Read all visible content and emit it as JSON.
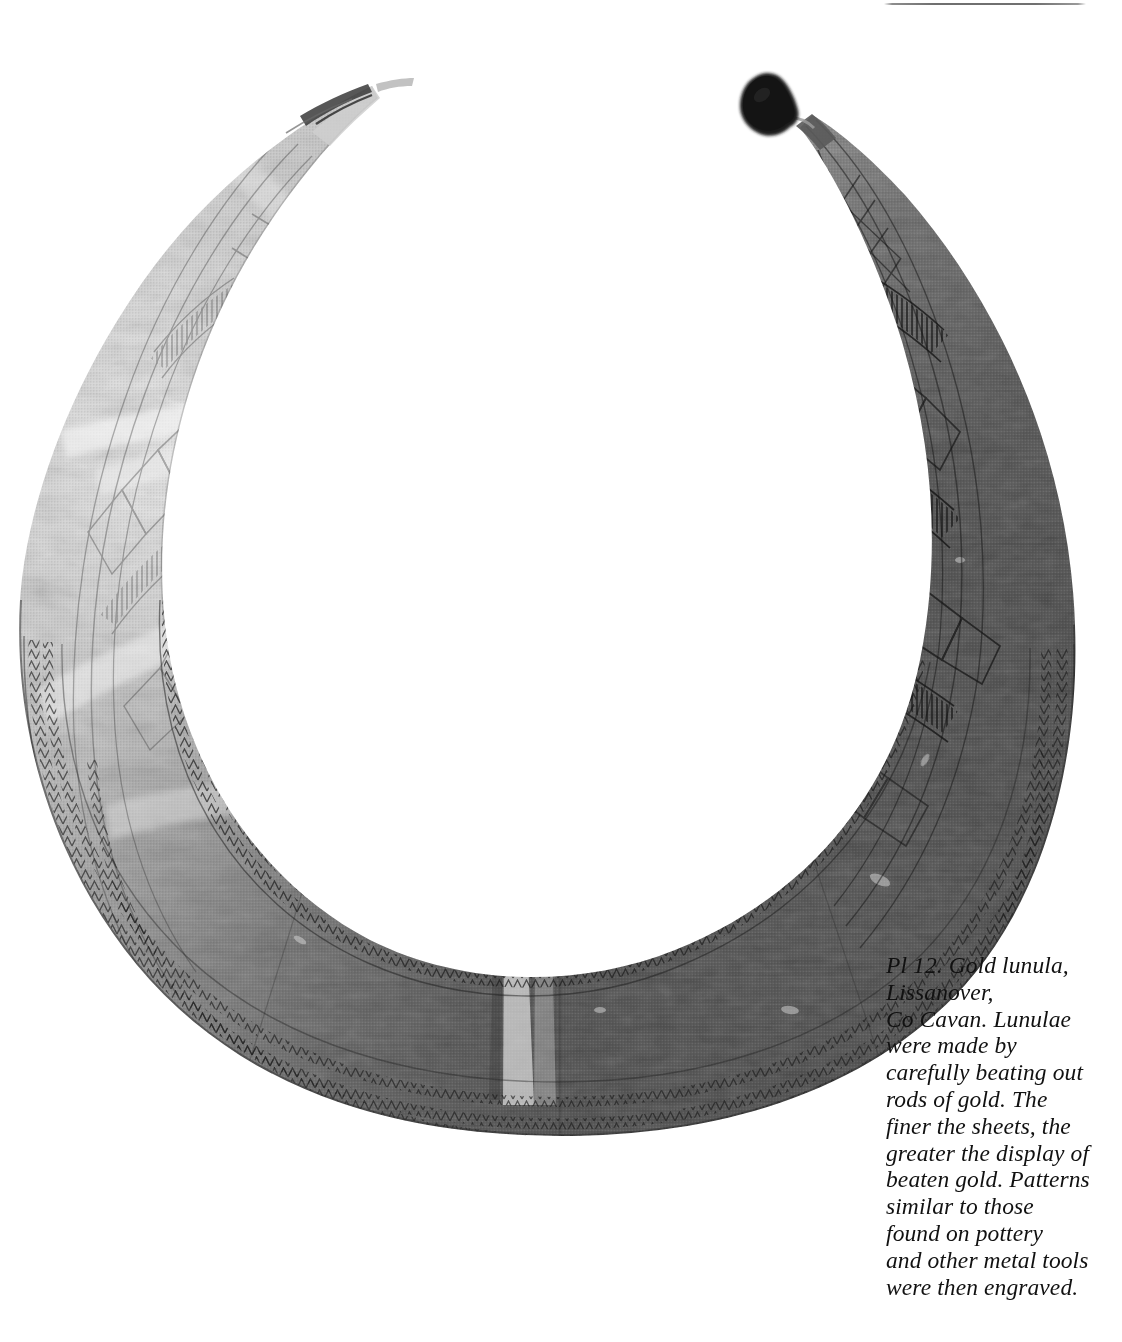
{
  "page": {
    "background_color": "#ffffff",
    "width": 1122,
    "height": 1342
  },
  "top_rule": {
    "name": "horizontal-rule",
    "color": "#707070"
  },
  "plate": {
    "label": "Pl 12",
    "subject": "Gold lunula",
    "object_name": "lunula",
    "material": "gold",
    "findspot": "Lissanover, Co Cavan",
    "image_type": "black-and-white halftone photograph",
    "colors": {
      "background": "#ffffff",
      "metal_light": "#d8d8d8",
      "metal_mid": "#9a9a9a",
      "metal_dark": "#4e4e4e",
      "metal_darkest": "#2f2f2f",
      "engraving_line": "#1f1f1f",
      "dark_blob": "#1a1a1a"
    },
    "features": [
      "crescent-shaped sheet-gold collar",
      "left terminal bright and reflective with small notch",
      "right terminal dark with engraved geometric bands",
      "dark mounting blob at right terminal tip",
      "engraved zigzag and chevron borders along inner and outer edges",
      "lozenge (diamond) motifs and hatched ladder bands on the horns",
      "triangle motifs near the terminals",
      "vertical crease / fold down the lower centre"
    ]
  },
  "caption": {
    "name": "plate-caption",
    "lines": [
      "Pl 12. Gold lunula,",
      "Lissanover,",
      "Co Cavan. Lunulae",
      "were made by",
      "carefully beating out",
      "rods of gold. The",
      "finer the sheets, the",
      "greater the display of",
      "beaten gold. Patterns",
      "similar to those",
      "found on pottery",
      "and other metal tools",
      "were then engraved."
    ],
    "text": "Pl 12. Gold lunula,\nLissanover,\nCo Cavan. Lunulae\nwere made by\ncarefully beating out\nrods of gold. The\nfiner the sheets, the\ngreater the display of\nbeaten gold. Patterns\nsimilar to those\nfound on pottery\nand other metal tools\nwere then engraved."
  }
}
